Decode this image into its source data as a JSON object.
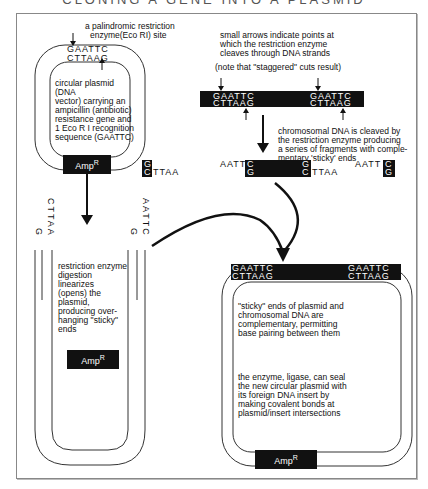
{
  "title": "CLONING A GENE INTO A PLASMID",
  "left_plasmid": {
    "caption": "a palindromic restriction",
    "caption2": "enzyme(Eco RI) site",
    "top_strand": "GAATTC",
    "bottom_strand": "CTTAAG",
    "description": [
      "circular plasmid (DNA",
      "vector) carrying an",
      "ampicillin (antibiotic)",
      "resistance gene and",
      "1 Eco R I recognition",
      "sequence (GAATTC)"
    ],
    "marker": "Amp",
    "marker_sup": "R"
  },
  "chromosome": {
    "caption": [
      "small arrows indicate points at",
      "which the restriction enzyme",
      "cleaves through DNA strands"
    ],
    "note": "(note that \"staggered\" cuts result)",
    "site1_top": "GAATTC",
    "site1_bottom": "CTTAAG",
    "site2_top": "GAATTC",
    "site2_bottom": "CTTAAG",
    "cleave_text": [
      "chromosomal DNA is cleaved by",
      "the restriction enzyme producing",
      "a series of fragments with comple-",
      "mentary 'sticky' ends"
    ],
    "frag1_g": "G",
    "frag1_c": "C",
    "frag1_ttaa": "TTAA",
    "frag2_aatt": "AATT",
    "frag2_c": "C",
    "frag2_g": "G",
    "frag2_g2": "G",
    "frag2_c2": "C",
    "frag2_ttaa": "TTAA",
    "frag3_aatt": "AATT",
    "frag3_c": "C",
    "frag3_g": "G"
  },
  "linear_plasmid": {
    "left_g": "G",
    "left_cttaa": "CTTAA",
    "right_g": "G",
    "right_aattc": "AATTC",
    "description": [
      "restriction enzyme",
      "digestion linearizes",
      "(opens) the plasmid,",
      "producing over-",
      "hanging \"sticky\" ends"
    ],
    "marker": "Amp",
    "marker_sup": "R"
  },
  "recombinant_plasmid": {
    "left_top": "GAATTC",
    "left_bottom": "CTTAAG",
    "right_top": "GAATTC",
    "right_bottom": "CTTAAG",
    "description1": [
      "\"sticky\" ends of plasmid and",
      "chromosomal DNA are",
      "complementary, permitting",
      "base pairing between them"
    ],
    "description2": [
      "the enzyme, ligase, can seal",
      "the new circular plasmid with",
      "its foreign DNA insert by",
      "making covalent bonds at",
      "plasmid/insert intersections"
    ],
    "marker": "Amp",
    "marker_sup": "R"
  }
}
